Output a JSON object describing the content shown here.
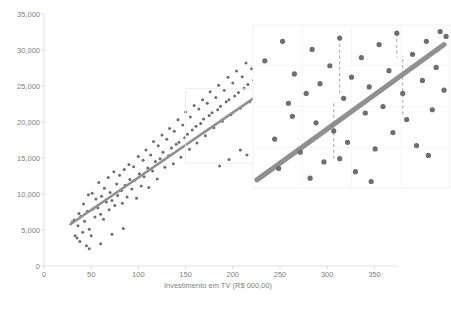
{
  "chart_data": {
    "type": "scatter",
    "title": "",
    "xlabel": "Investimento em TV (R$ 000,00)",
    "ylabel": "",
    "xlim": [
      0,
      375
    ],
    "ylim": [
      0,
      35000
    ],
    "grid": false,
    "legend": null,
    "xticks": [
      "0",
      "50",
      "100",
      "150",
      "200",
      "250",
      "300",
      "350"
    ],
    "xtick_values": [
      0,
      50,
      100,
      150,
      200,
      250,
      300,
      350
    ],
    "yticks": [
      "0",
      "5,000",
      "10,000",
      "15,000",
      "20,000",
      "25,000",
      "30,000",
      "35,000"
    ],
    "ytick_values": [
      0,
      5000,
      10000,
      15000,
      20000,
      25000,
      30000,
      35000
    ],
    "series": [
      {
        "name": "Observacoes",
        "marker": "circle",
        "color": "#6e6e6e",
        "points": [
          [
            30,
            6100
          ],
          [
            32,
            6400
          ],
          [
            33,
            4200
          ],
          [
            35,
            3900
          ],
          [
            36,
            5600
          ],
          [
            37,
            7300
          ],
          [
            38,
            3400
          ],
          [
            39,
            6900
          ],
          [
            41,
            4700
          ],
          [
            42,
            8600
          ],
          [
            43,
            6200
          ],
          [
            45,
            2800
          ],
          [
            46,
            7600
          ],
          [
            47,
            9900
          ],
          [
            48,
            5100
          ],
          [
            50,
            4200
          ],
          [
            51,
            10100
          ],
          [
            52,
            7900
          ],
          [
            54,
            6800
          ],
          [
            55,
            9300
          ],
          [
            57,
            8100
          ],
          [
            58,
            11600
          ],
          [
            60,
            7200
          ],
          [
            61,
            9700
          ],
          [
            63,
            6500
          ],
          [
            64,
            10800
          ],
          [
            66,
            8900
          ],
          [
            68,
            12300
          ],
          [
            69,
            7800
          ],
          [
            70,
            10200
          ],
          [
            72,
            9100
          ],
          [
            74,
            13100
          ],
          [
            75,
            8400
          ],
          [
            77,
            11400
          ],
          [
            78,
            9800
          ],
          [
            80,
            12600
          ],
          [
            82,
            10500
          ],
          [
            83,
            8700
          ],
          [
            85,
            13400
          ],
          [
            86,
            11200
          ],
          [
            88,
            9600
          ],
          [
            90,
            14100
          ],
          [
            91,
            12000
          ],
          [
            93,
            10700
          ],
          [
            95,
            13800
          ],
          [
            96,
            11900
          ],
          [
            98,
            9400
          ],
          [
            100,
            15200
          ],
          [
            101,
            12800
          ],
          [
            103,
            11100
          ],
          [
            105,
            14700
          ],
          [
            106,
            12400
          ],
          [
            108,
            16100
          ],
          [
            110,
            13600
          ],
          [
            111,
            10900
          ],
          [
            113,
            15400
          ],
          [
            115,
            13200
          ],
          [
            116,
            17300
          ],
          [
            118,
            14500
          ],
          [
            120,
            12100
          ],
          [
            121,
            16700
          ],
          [
            123,
            14900
          ],
          [
            125,
            18200
          ],
          [
            126,
            15800
          ],
          [
            128,
            13700
          ],
          [
            130,
            17600
          ],
          [
            132,
            15300
          ],
          [
            133,
            19100
          ],
          [
            135,
            16400
          ],
          [
            137,
            14200
          ],
          [
            138,
            18700
          ],
          [
            140,
            16900
          ],
          [
            142,
            20300
          ],
          [
            143,
            17200
          ],
          [
            145,
            15100
          ],
          [
            147,
            19600
          ],
          [
            149,
            17800
          ],
          [
            150,
            21400
          ],
          [
            152,
            18300
          ],
          [
            154,
            16200
          ],
          [
            155,
            20700
          ],
          [
            157,
            18900
          ],
          [
            159,
            22300
          ],
          [
            161,
            19400
          ],
          [
            162,
            17100
          ],
          [
            164,
            21800
          ],
          [
            166,
            19800
          ],
          [
            168,
            23100
          ],
          [
            169,
            20400
          ],
          [
            171,
            18100
          ],
          [
            173,
            22600
          ],
          [
            175,
            20900
          ],
          [
            176,
            24200
          ],
          [
            178,
            21300
          ],
          [
            180,
            19200
          ],
          [
            182,
            23400
          ],
          [
            184,
            21700
          ],
          [
            185,
            25100
          ],
          [
            187,
            22200
          ],
          [
            189,
            20100
          ],
          [
            191,
            24400
          ],
          [
            193,
            22800
          ],
          [
            195,
            26200
          ],
          [
            196,
            23100
          ],
          [
            198,
            21000
          ],
          [
            200,
            25400
          ],
          [
            202,
            23600
          ],
          [
            204,
            27100
          ],
          [
            206,
            24100
          ],
          [
            208,
            21900
          ],
          [
            210,
            26300
          ],
          [
            212,
            24700
          ],
          [
            214,
            28200
          ],
          [
            216,
            25200
          ],
          [
            218,
            22800
          ],
          [
            220,
            27400
          ],
          [
            222,
            25800
          ],
          [
            224,
            29100
          ],
          [
            226,
            26100
          ],
          [
            228,
            23700
          ],
          [
            230,
            28300
          ],
          [
            232,
            26700
          ],
          [
            234,
            30100
          ],
          [
            236,
            27200
          ],
          [
            238,
            24600
          ],
          [
            240,
            29300
          ],
          [
            242,
            27600
          ],
          [
            244,
            31100
          ],
          [
            246,
            28100
          ],
          [
            248,
            25400
          ],
          [
            250,
            30200
          ],
          [
            252,
            28600
          ],
          [
            254,
            31900
          ],
          [
            256,
            29100
          ],
          [
            258,
            26200
          ],
          [
            260,
            31000
          ],
          [
            262,
            29500
          ],
          [
            264,
            32600
          ],
          [
            266,
            30100
          ],
          [
            268,
            27100
          ],
          [
            270,
            31700
          ],
          [
            272,
            30300
          ],
          [
            274,
            33100
          ],
          [
            276,
            30800
          ],
          [
            278,
            28000
          ],
          [
            280,
            32200
          ],
          [
            282,
            31000
          ],
          [
            285,
            29400
          ],
          [
            288,
            32700
          ],
          [
            292,
            30500
          ],
          [
            296,
            31600
          ],
          [
            300,
            29800
          ],
          [
            305,
            31200
          ],
          [
            196,
            14800
          ],
          [
            208,
            16100
          ],
          [
            215,
            15400
          ],
          [
            186,
            13900
          ],
          [
            232,
            17200
          ],
          [
            60,
            3100
          ],
          [
            72,
            4400
          ],
          [
            84,
            5200
          ],
          [
            48,
            2400
          ]
        ]
      }
    ],
    "trendline": {
      "name": "Linha de tendencia",
      "color": "#909090",
      "x_start": 28,
      "y_start": 5800,
      "x_end": 292,
      "y_end": 29600
    }
  },
  "inset": {
    "name": "magnified-region",
    "source_region": {
      "x0": 150,
      "x1": 232,
      "y0": 14300,
      "y1": 24600
    },
    "trendline_color": "#909090",
    "point_color": "#6e6e6e",
    "residual_color": "#a8a8a8",
    "points": [
      [
        0.06,
        0.78
      ],
      [
        0.11,
        0.3
      ],
      [
        0.13,
        0.12
      ],
      [
        0.18,
        0.52
      ],
      [
        0.2,
        0.44
      ],
      [
        0.21,
        0.7
      ],
      [
        0.24,
        0.22
      ],
      [
        0.27,
        0.58
      ],
      [
        0.3,
        0.85
      ],
      [
        0.32,
        0.4
      ],
      [
        0.34,
        0.64
      ],
      [
        0.36,
        0.16
      ],
      [
        0.39,
        0.75
      ],
      [
        0.41,
        0.35
      ],
      [
        0.44,
        0.92
      ],
      [
        0.46,
        0.55
      ],
      [
        0.48,
        0.28
      ],
      [
        0.5,
        0.68
      ],
      [
        0.52,
        0.1
      ],
      [
        0.55,
        0.8
      ],
      [
        0.57,
        0.46
      ],
      [
        0.59,
        0.62
      ],
      [
        0.62,
        0.24
      ],
      [
        0.64,
        0.88
      ],
      [
        0.66,
        0.5
      ],
      [
        0.69,
        0.72
      ],
      [
        0.71,
        0.34
      ],
      [
        0.73,
        0.95
      ],
      [
        0.76,
        0.58
      ],
      [
        0.78,
        0.42
      ],
      [
        0.81,
        0.82
      ],
      [
        0.83,
        0.26
      ],
      [
        0.86,
        0.66
      ],
      [
        0.88,
        0.9
      ],
      [
        0.91,
        0.48
      ],
      [
        0.93,
        0.74
      ],
      [
        0.95,
        0.96
      ],
      [
        0.97,
        0.6
      ],
      [
        0.98,
        0.93
      ],
      [
        0.15,
        0.9
      ],
      [
        0.29,
        0.06
      ],
      [
        0.6,
        0.04
      ],
      [
        0.44,
        0.18
      ],
      [
        0.89,
        0.2
      ]
    ],
    "residuals": [
      {
        "x": 0.44,
        "y_point": 0.92,
        "y_line": 0.58
      },
      {
        "x": 0.41,
        "y_point": 0.18,
        "y_line": 0.52
      },
      {
        "x": 0.73,
        "y_point": 0.95,
        "y_line": 0.8
      },
      {
        "x": 0.76,
        "y_point": 0.45,
        "y_line": 0.81
      }
    ]
  }
}
